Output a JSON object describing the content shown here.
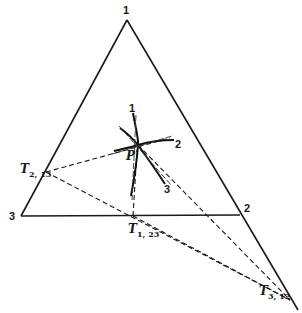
{
  "diagram": {
    "vertices": [
      {
        "id": "v1",
        "label": "1",
        "x": 127,
        "y": 20
      },
      {
        "id": "v2",
        "label": "2",
        "x": 240,
        "y": 215
      },
      {
        "id": "v3",
        "label": "3",
        "x": 21,
        "y": 216
      }
    ],
    "point_P": {
      "label": "P",
      "x": 138,
      "y": 145
    },
    "curve_labels": [
      {
        "label": "1",
        "x": 133,
        "y": 110
      },
      {
        "label": "2",
        "x": 178,
        "y": 143
      },
      {
        "label": "3",
        "x": 168,
        "y": 189
      }
    ],
    "trace_points": [
      {
        "id": "T2_13",
        "main": "T",
        "sub": "2, 13",
        "x": 46,
        "y": 172
      },
      {
        "id": "T1_23",
        "main": "T",
        "sub": "1, 23",
        "x": 133,
        "y": 216
      },
      {
        "id": "T3_12",
        "main": "T",
        "sub": "3, 12",
        "x": 290,
        "y": 300
      }
    ]
  }
}
